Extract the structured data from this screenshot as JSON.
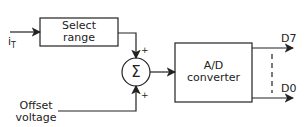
{
  "diagram": {
    "input_label": "i",
    "input_subscript": "T",
    "select_range": {
      "line1": "Select",
      "line2": "range"
    },
    "summer_symbol": "Σ",
    "summer_plus_top": "+",
    "summer_plus_bottom": "+",
    "offset": {
      "line1": "Offset",
      "line2": "voltage"
    },
    "converter": {
      "line1": "A/D",
      "line2": "converter"
    },
    "outputs": {
      "msb": "D7",
      "lsb": "D0"
    }
  }
}
